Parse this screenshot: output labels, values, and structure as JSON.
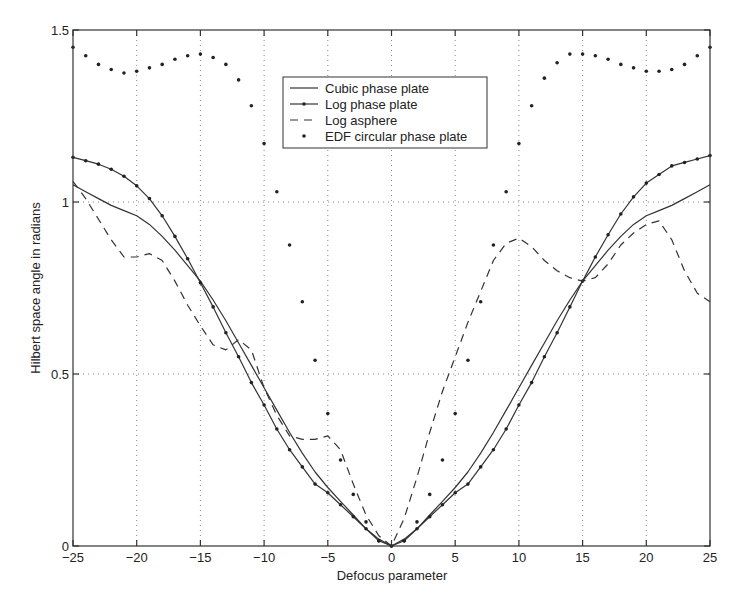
{
  "chart_data": {
    "type": "line",
    "title": "",
    "xlabel": "Defocus parameter",
    "ylabel": "Hilbert space angle in radians",
    "xlim": [
      -25,
      25
    ],
    "ylim": [
      0,
      1.5
    ],
    "grid": true,
    "x_ticks": [
      -25,
      -20,
      -15,
      -10,
      -5,
      0,
      5,
      10,
      15,
      20,
      25
    ],
    "x_tick_labels": [
      "−25",
      "−20",
      "−15",
      "−10",
      "−5",
      "0",
      "5",
      "10",
      "15",
      "20",
      "25"
    ],
    "y_ticks": [
      0,
      0.5,
      1,
      1.5
    ],
    "y_tick_labels": [
      "0",
      "0.5",
      "1",
      "1.5"
    ],
    "legend_position": "upper center",
    "x": [
      -25,
      -24,
      -23,
      -22,
      -21,
      -20,
      -19,
      -18,
      -17,
      -16,
      -15,
      -14,
      -13,
      -12,
      -11,
      -10,
      -9,
      -8,
      -7,
      -6,
      -5,
      -4,
      -3,
      -2,
      -1,
      0,
      1,
      2,
      3,
      4,
      5,
      6,
      7,
      8,
      9,
      10,
      11,
      12,
      13,
      14,
      15,
      16,
      17,
      18,
      19,
      20,
      21,
      22,
      23,
      24,
      25
    ],
    "series": [
      {
        "name": "Cubic phase plate",
        "style": "solid",
        "values": [
          1.05,
          1.03,
          1.01,
          0.99,
          0.975,
          0.96,
          0.935,
          0.9,
          0.86,
          0.815,
          0.77,
          0.715,
          0.655,
          0.59,
          0.525,
          0.46,
          0.395,
          0.33,
          0.27,
          0.215,
          0.17,
          0.13,
          0.09,
          0.05,
          0.02,
          0.0,
          0.02,
          0.05,
          0.09,
          0.13,
          0.17,
          0.215,
          0.27,
          0.33,
          0.395,
          0.46,
          0.525,
          0.59,
          0.655,
          0.715,
          0.77,
          0.815,
          0.86,
          0.9,
          0.935,
          0.96,
          0.975,
          0.99,
          1.01,
          1.03,
          1.05
        ]
      },
      {
        "name": "Log phase plate",
        "style": "solid-dot",
        "values": [
          1.13,
          1.12,
          1.11,
          1.095,
          1.075,
          1.047,
          1.01,
          0.96,
          0.9,
          0.835,
          0.765,
          0.695,
          0.62,
          0.55,
          0.475,
          0.41,
          0.34,
          0.28,
          0.23,
          0.18,
          0.155,
          0.12,
          0.085,
          0.05,
          0.015,
          0.0,
          0.015,
          0.05,
          0.085,
          0.12,
          0.155,
          0.18,
          0.23,
          0.28,
          0.34,
          0.41,
          0.475,
          0.55,
          0.62,
          0.695,
          0.77,
          0.84,
          0.905,
          0.965,
          1.015,
          1.055,
          1.08,
          1.105,
          1.115,
          1.125,
          1.135
        ]
      },
      {
        "name": "Log asphere",
        "style": "dashed",
        "values": [
          1.06,
          1.01,
          0.95,
          0.89,
          0.84,
          0.84,
          0.85,
          0.83,
          0.77,
          0.7,
          0.64,
          0.585,
          0.57,
          0.6,
          0.57,
          0.46,
          0.38,
          0.32,
          0.31,
          0.31,
          0.32,
          0.28,
          0.18,
          0.09,
          0.03,
          0.0,
          0.08,
          0.2,
          0.33,
          0.45,
          0.55,
          0.65,
          0.74,
          0.83,
          0.88,
          0.895,
          0.87,
          0.83,
          0.8,
          0.78,
          0.77,
          0.78,
          0.82,
          0.875,
          0.91,
          0.935,
          0.945,
          0.89,
          0.8,
          0.735,
          0.71
        ]
      },
      {
        "name": "EDF circular phase plate",
        "style": "dots",
        "values": [
          1.45,
          1.425,
          1.4,
          1.385,
          1.375,
          1.38,
          1.39,
          1.4,
          1.415,
          1.425,
          1.43,
          1.42,
          1.4,
          1.355,
          1.28,
          1.17,
          1.03,
          0.875,
          0.71,
          0.54,
          0.385,
          0.25,
          0.15,
          0.07,
          0.015,
          0.0,
          0.015,
          0.07,
          0.15,
          0.25,
          0.385,
          0.54,
          0.71,
          0.875,
          1.03,
          1.17,
          1.28,
          1.36,
          1.405,
          1.43,
          1.43,
          1.425,
          1.415,
          1.4,
          1.39,
          1.38,
          1.38,
          1.385,
          1.4,
          1.425,
          1.45
        ]
      }
    ]
  }
}
